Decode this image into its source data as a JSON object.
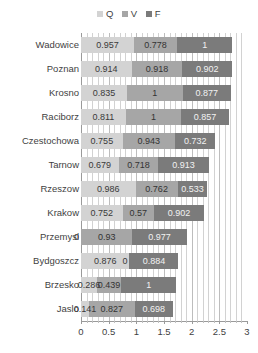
{
  "chart_data": {
    "type": "bar",
    "orientation": "horizontal",
    "stacked": true,
    "title": "",
    "subtitle": "",
    "xlabel": "",
    "ylabel": "",
    "xlim": [
      0,
      3
    ],
    "xticks": [
      0,
      0.5,
      1,
      1.5,
      2,
      2.5,
      3
    ],
    "xtick_labels": [
      "0",
      "0.5",
      "1",
      "1.5",
      "2",
      "2.5",
      "3"
    ],
    "grid": true,
    "grid_minor_step": 0.1,
    "legend_position": "top-center",
    "categories": [
      "Wadowice",
      "Poznan",
      "Krosno",
      "Raciborz",
      "Czestochowa",
      "Tarnow",
      "Rzeszow",
      "Krakow",
      "Przemysl",
      "Bydgoszcz",
      "Brzesko",
      "Jaslo"
    ],
    "series": [
      {
        "name": "Q",
        "color": "#d3d3d3",
        "values": [
          0.957,
          0.914,
          0.835,
          0.811,
          0.755,
          0.679,
          0.986,
          0.752,
          0,
          0.876,
          0.286,
          0.141
        ],
        "labels": [
          "0.957",
          "0.914",
          "0.835",
          "0.811",
          "0.755",
          "0.679",
          "0.986",
          "0.752",
          "0",
          "0.876",
          "0.286",
          "0.141"
        ]
      },
      {
        "name": "V",
        "color": "#a6a6a6",
        "values": [
          0.778,
          0.918,
          1,
          1,
          0.943,
          0.718,
          0.762,
          0.57,
          0.93,
          0,
          0.439,
          0.827
        ],
        "labels": [
          "0.778",
          "0.918",
          "1",
          "1",
          "0.943",
          "0.718",
          "0.762",
          "0.57",
          "0.93",
          "0",
          "0.439",
          "0.827"
        ]
      },
      {
        "name": "F",
        "color": "#7b7b7b",
        "values": [
          1,
          0.902,
          0.877,
          0.857,
          0.732,
          0.913,
          0.533,
          0.902,
          0.977,
          0.884,
          1,
          0.698
        ],
        "labels": [
          "1",
          "0.902",
          "0.877",
          "0.857",
          "0.732",
          "0.913",
          "0.533",
          "0.902",
          "0.977",
          "0.884",
          "1",
          "0.698"
        ]
      }
    ],
    "totals": [
      2.735,
      2.734,
      2.712,
      2.668,
      2.43,
      2.31,
      2.281,
      2.224,
      1.907,
      1.76,
      1.725,
      1.666
    ]
  },
  "legend": {
    "items": [
      {
        "label": "Q",
        "color": "#d3d3d3"
      },
      {
        "label": "V",
        "color": "#a6a6a6"
      },
      {
        "label": "F",
        "color": "#7b7b7b"
      }
    ]
  },
  "colors": {
    "series_q": "#d3d3d3",
    "series_v": "#a6a6a6",
    "series_f": "#7b7b7b",
    "gridline": "#d2d2d2",
    "axis": "#9a9a9a",
    "text": "#3f3f3f",
    "background": "#ffffff"
  }
}
